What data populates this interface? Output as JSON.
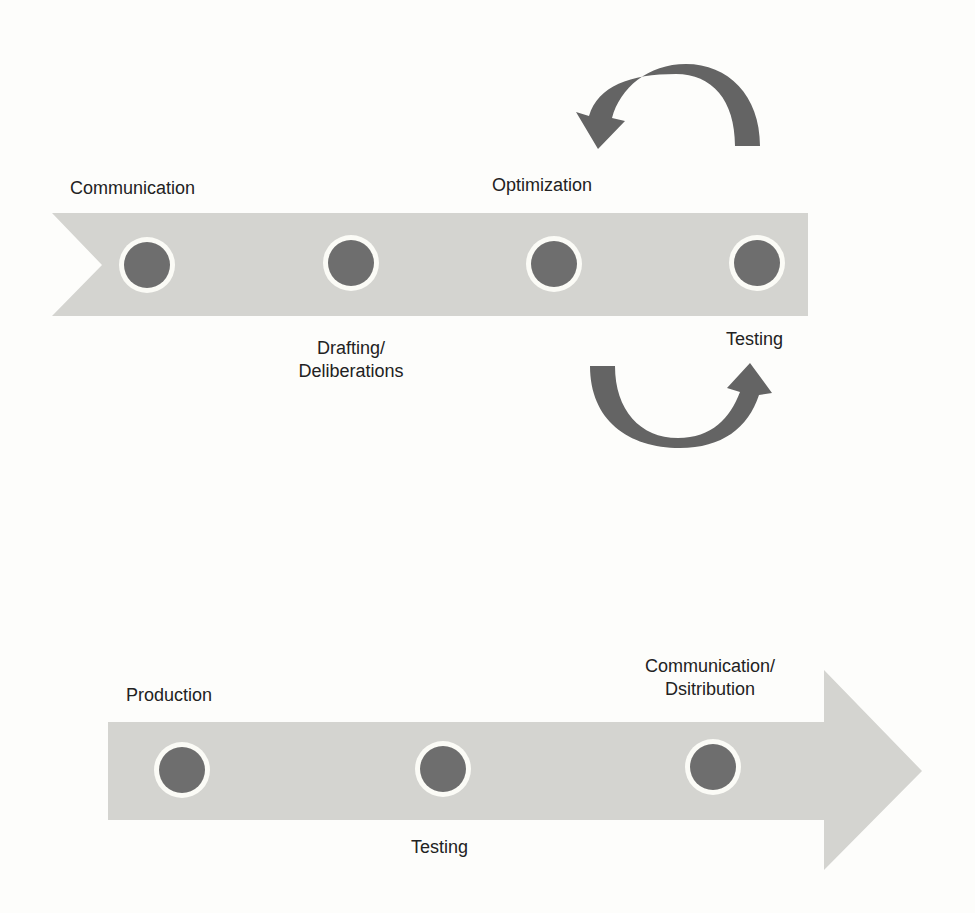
{
  "colors": {
    "background": "#fdfdfb",
    "ribbon": "#d4d4d0",
    "node_fill": "#6e6e6e",
    "node_ring": "#fbfbf6",
    "loop_arrow": "#646464",
    "text": "#222222"
  },
  "top_flow": {
    "shape": "notched ribbon",
    "nodes": [
      {
        "label_lines": [
          "Communication"
        ],
        "label_position": "above"
      },
      {
        "label_lines": [
          "Drafting/",
          "Deliberations"
        ],
        "label_position": "below"
      },
      {
        "label_lines": [
          "Optimization"
        ],
        "label_position": "above"
      },
      {
        "label_lines": [
          "Testing"
        ],
        "label_position": "below"
      }
    ],
    "loop_arrows": [
      {
        "name": "curved-arrow-top",
        "direction": "counterclockwise, from Testing back to Optimization"
      },
      {
        "name": "curved-arrow-bottom",
        "direction": "from Optimization forward to Testing"
      }
    ]
  },
  "bottom_flow": {
    "shape": "block arrow pointing right",
    "nodes": [
      {
        "label_lines": [
          "Production"
        ],
        "label_position": "above"
      },
      {
        "label_lines": [
          "Testing"
        ],
        "label_position": "below"
      },
      {
        "label_lines": [
          "Communication/",
          "Dsitribution"
        ],
        "label_position": "above"
      }
    ]
  }
}
